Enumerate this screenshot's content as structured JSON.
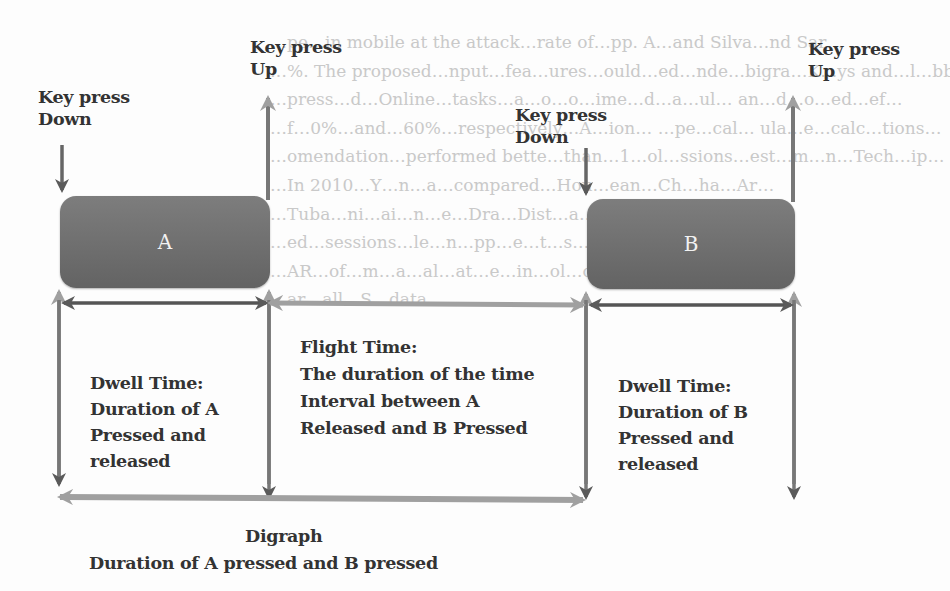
{
  "background_text": [
    "…pe…in mobile at the attack…rate of…pp. A…and Silva…nd Sar…",
    "…%. The proposed…nput…fea…ures…ould…ed…nde…bigra…K…ys and…l…bbe…",
    "…press…d…Online…tasks…a…o…o…ime…d…a…ul… an…d…o…ed…ef…",
    "…f…0%…and…60%…respectively…A…ion… …pe…cal… ula…e…calc…tions…",
    "…omendation…performed bette…than…1…ol…ssions…est…m…n…Tech…ip…",
    "…In 2010…Y…n…a…compared…Hou…ean…Ch…ha…Ar…",
    "…Tuba…ni…ai…n…e…Dra…Dist…a…l…avg…s…Ar…lysis…",
    "…ed…sessions…le…n…pp…e…t…s…n…e…ke…e…bled…v…",
    "…AR…of…m…a…al…at…e…in…ol…of…sa…p…es…ri…d…",
    "…ar…all…S…data…"
  ],
  "labels": {
    "a_down": [
      "Key press",
      "Down"
    ],
    "a_up": [
      "Key press",
      "Up"
    ],
    "b_down": [
      "Key press",
      "Down"
    ],
    "b_up": [
      "Key press",
      "Up"
    ],
    "key_a": "A",
    "key_b": "B",
    "dwell_a": [
      "Dwell Time:",
      "Duration of A",
      "Pressed and",
      "released"
    ],
    "flight": [
      "Flight Time:",
      "The duration of the time",
      "Interval between A",
      "Released and B Pressed"
    ],
    "dwell_b": [
      "Dwell Time:",
      "Duration of B",
      "Pressed and",
      "released"
    ],
    "digraph_title": "Digraph",
    "digraph_desc": "Duration of A pressed and B pressed"
  },
  "colors": {
    "key_fill": "#6e6e6e",
    "dark_arrow": "#555555",
    "light_arrow": "#9a9a9a",
    "text": "#333333"
  }
}
